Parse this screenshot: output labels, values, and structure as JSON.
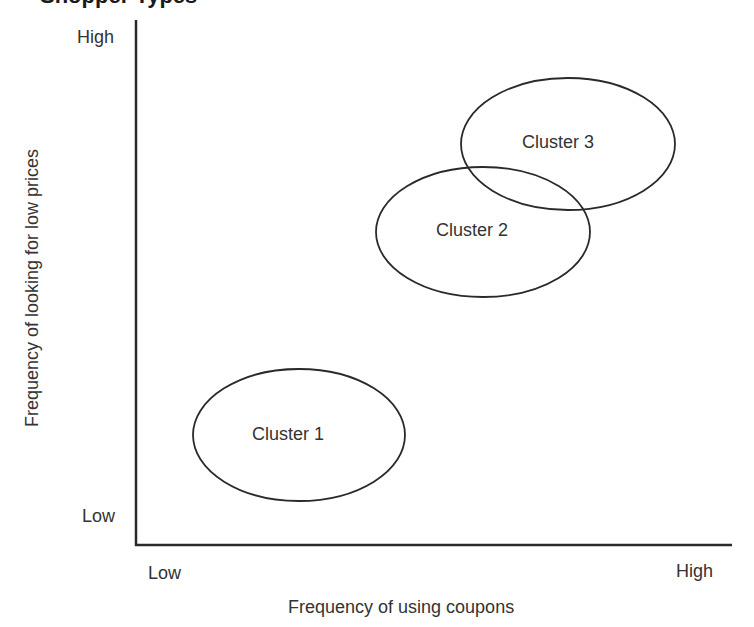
{
  "title": "Shopper Types",
  "axes": {
    "x_label": "Frequency of using coupons",
    "y_label": "Frequency of looking for low prices",
    "x_low": "Low",
    "x_high": "High",
    "y_low": "Low",
    "y_high": "High"
  },
  "clusters": [
    {
      "label": "Cluster 1",
      "cx": 299,
      "cy": 435,
      "rx": 106,
      "ry": 66
    },
    {
      "label": "Cluster 2",
      "cx": 483,
      "cy": 232,
      "rx": 107,
      "ry": 65
    },
    {
      "label": "Cluster 3",
      "cx": 568,
      "cy": 144,
      "rx": 107,
      "ry": 66
    }
  ],
  "colors": {
    "stroke": "#2a2a2a",
    "background": "#ffffff"
  }
}
